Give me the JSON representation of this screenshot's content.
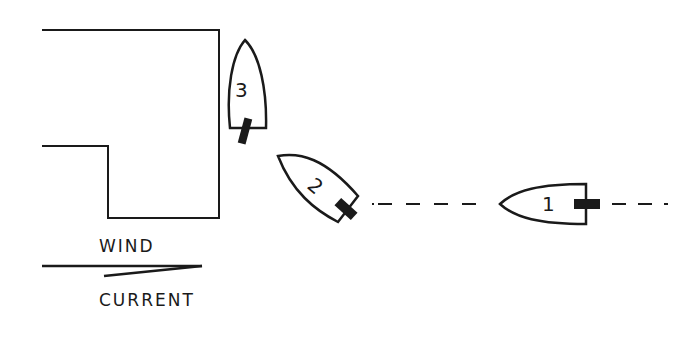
{
  "diagram": {
    "type": "boat maneuvering diagram",
    "colors": {
      "ink": "#1a1a1a",
      "background": "#ffffff"
    },
    "boats": [
      {
        "id": "boat-1",
        "number": "1",
        "orientation": "heading left (west)"
      },
      {
        "id": "boat-2",
        "number": "2",
        "orientation": "heading up-left (northwest)"
      },
      {
        "id": "boat-3",
        "number": "3",
        "orientation": "heading up (north)"
      }
    ],
    "dock": {
      "description": "L-shaped pier / slip outline"
    },
    "path": {
      "description": "dashed track line behind boats 1 and 2"
    },
    "legend": {
      "wind_label": "WIND",
      "current_label": "CURRENT"
    }
  }
}
